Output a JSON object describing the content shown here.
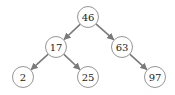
{
  "diagram": {
    "type": "binary-search-tree",
    "edge_color": "#7a7a7a",
    "node_stroke": "#8a8a8a",
    "nodes": [
      {
        "id": "n46",
        "label": "46",
        "cx": 88,
        "cy": 17
      },
      {
        "id": "n17",
        "label": "17",
        "cx": 56,
        "cy": 47
      },
      {
        "id": "n63",
        "label": "63",
        "cx": 122,
        "cy": 47
      },
      {
        "id": "n2",
        "label": "2",
        "cx": 23,
        "cy": 77
      },
      {
        "id": "n25",
        "label": "25",
        "cx": 88,
        "cy": 77
      },
      {
        "id": "n97",
        "label": "97",
        "cx": 155,
        "cy": 77
      }
    ],
    "edges": [
      {
        "from": "46",
        "to": "17"
      },
      {
        "from": "46",
        "to": "63"
      },
      {
        "from": "17",
        "to": "2"
      },
      {
        "from": "17",
        "to": "25"
      },
      {
        "from": "63",
        "to": "97"
      }
    ]
  }
}
